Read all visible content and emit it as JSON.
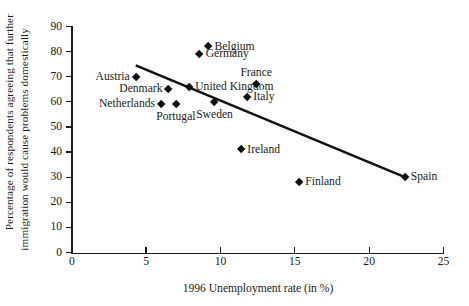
{
  "chart_data": {
    "type": "scatter",
    "title": "",
    "xlabel": "1996 Unemployment rate (in %)",
    "ylabel_line1": "Percentage of respondents agreeing that further",
    "ylabel_line2": "immigration would cause problems domestically",
    "xlim": [
      0,
      25
    ],
    "ylim": [
      0,
      90
    ],
    "xticks": [
      0,
      5,
      10,
      15,
      20,
      25
    ],
    "yticks": [
      0,
      10,
      20,
      30,
      40,
      50,
      60,
      70,
      80,
      90
    ],
    "grid": false,
    "legend": "none",
    "marker": "diamond",
    "marker_color": "#111111",
    "points": [
      {
        "label": "Austria",
        "x": 4.3,
        "y": 70,
        "label_pos": "left"
      },
      {
        "label": "Netherlands",
        "x": 6.0,
        "y": 59,
        "label_pos": "left"
      },
      {
        "label": "Denmark",
        "x": 6.5,
        "y": 65,
        "label_pos": "left"
      },
      {
        "label": "Portugal",
        "x": 7.0,
        "y": 59,
        "label_pos": "below"
      },
      {
        "label": "United Kingdom",
        "x": 7.9,
        "y": 66,
        "label_pos": "right"
      },
      {
        "label": "Germany",
        "x": 8.6,
        "y": 79,
        "label_pos": "right"
      },
      {
        "label": "Belgium",
        "x": 9.2,
        "y": 82,
        "label_pos": "right"
      },
      {
        "label": "Sweden",
        "x": 9.6,
        "y": 60,
        "label_pos": "below"
      },
      {
        "label": "Ireland",
        "x": 11.4,
        "y": 41,
        "label_pos": "right"
      },
      {
        "label": "Italy",
        "x": 11.8,
        "y": 62,
        "label_pos": "right"
      },
      {
        "label": "France",
        "x": 12.4,
        "y": 67,
        "label_pos": "above"
      },
      {
        "label": "Finland",
        "x": 15.3,
        "y": 28,
        "label_pos": "right"
      },
      {
        "label": "Spain",
        "x": 22.4,
        "y": 30,
        "label_pos": "right"
      }
    ],
    "trendline": {
      "x0": 4.3,
      "y0": 74.5,
      "x1": 22.4,
      "y1": 30.0,
      "color": "#111111"
    }
  }
}
